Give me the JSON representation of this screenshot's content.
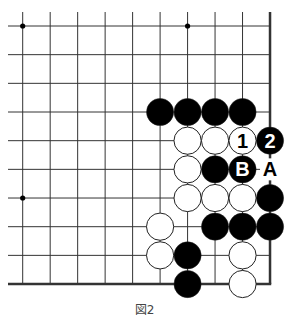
{
  "diagram": {
    "caption": "図2",
    "grid": {
      "cols": 10,
      "rows": 10,
      "x0": 22.7,
      "dx": 27.48,
      "y0": 26,
      "dy": 28.67,
      "top_edge_y": 12,
      "left_edge_x": 8,
      "right_edge": true,
      "bottom_edge": true
    },
    "star_points": [
      [
        0,
        0
      ],
      [
        6,
        0
      ],
      [
        0,
        6
      ]
    ],
    "stones": [
      {
        "col": 5,
        "row": 3,
        "color": "black",
        "label": ""
      },
      {
        "col": 6,
        "row": 3,
        "color": "black",
        "label": ""
      },
      {
        "col": 7,
        "row": 3,
        "color": "black",
        "label": ""
      },
      {
        "col": 8,
        "row": 3,
        "color": "black",
        "label": ""
      },
      {
        "col": 6,
        "row": 4,
        "color": "white",
        "label": ""
      },
      {
        "col": 7,
        "row": 4,
        "color": "white",
        "label": ""
      },
      {
        "col": 8,
        "row": 4,
        "color": "white",
        "label": "1"
      },
      {
        "col": 9,
        "row": 4,
        "color": "black",
        "label": "2"
      },
      {
        "col": 6,
        "row": 5,
        "color": "white",
        "label": ""
      },
      {
        "col": 7,
        "row": 5,
        "color": "black",
        "label": ""
      },
      {
        "col": 8,
        "row": 5,
        "color": "black",
        "label": "B"
      },
      {
        "col": 6,
        "row": 6,
        "color": "white",
        "label": ""
      },
      {
        "col": 7,
        "row": 6,
        "color": "white",
        "label": ""
      },
      {
        "col": 8,
        "row": 6,
        "color": "white",
        "label": ""
      },
      {
        "col": 9,
        "row": 6,
        "color": "black",
        "label": ""
      },
      {
        "col": 5,
        "row": 7,
        "color": "white",
        "label": ""
      },
      {
        "col": 7,
        "row": 7,
        "color": "black",
        "label": ""
      },
      {
        "col": 8,
        "row": 7,
        "color": "black",
        "label": ""
      },
      {
        "col": 9,
        "row": 7,
        "color": "black",
        "label": ""
      },
      {
        "col": 5,
        "row": 8,
        "color": "white",
        "label": ""
      },
      {
        "col": 6,
        "row": 8,
        "color": "black",
        "label": ""
      },
      {
        "col": 8,
        "row": 8,
        "color": "white",
        "label": ""
      },
      {
        "col": 6,
        "row": 9,
        "color": "black",
        "label": ""
      },
      {
        "col": 8,
        "row": 9,
        "color": "white",
        "label": ""
      }
    ],
    "point_labels": [
      {
        "col": 9,
        "row": 5,
        "text": "A"
      }
    ],
    "colors": {
      "line": "#333333",
      "black_stone": "#000000",
      "white_stone": "#ffffff",
      "stone_outline": "#222222"
    }
  }
}
